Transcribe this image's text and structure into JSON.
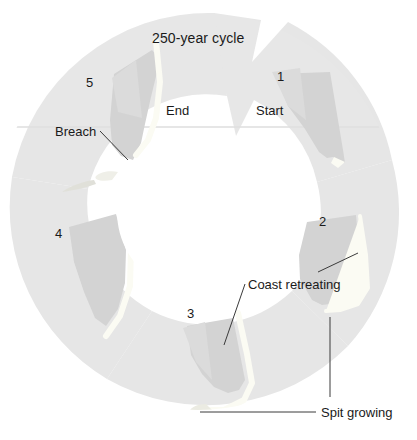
{
  "figure": {
    "title": "250-year cycle",
    "type": "cycle-diagram",
    "colors": {
      "background": "#ffffff",
      "ring": "#e6e6e6",
      "ring_shadow": "#dedede",
      "land_wedge": "#d2d2d2",
      "land_wedge_light": "#dcdcdc",
      "spit": "#fbfbf5",
      "leader_line": "#3a3a3a",
      "text": "#1a1a1a"
    }
  },
  "stages": [
    {
      "number": "1",
      "caption": "Start",
      "num_x": 277,
      "num_y": 69,
      "cap_x": 258,
      "cap_y": 103
    },
    {
      "number": "2",
      "caption": "",
      "num_x": 319,
      "num_y": 214,
      "cap_x": 0,
      "cap_y": 0
    },
    {
      "number": "3",
      "caption": "",
      "num_x": 187,
      "num_y": 306,
      "cap_x": 0,
      "cap_y": 0
    },
    {
      "number": "4",
      "caption": "",
      "num_x": 55,
      "num_y": 226,
      "cap_x": 0,
      "cap_y": 0
    },
    {
      "number": "5",
      "caption": "End",
      "num_x": 86,
      "num_y": 75,
      "cap_x": 167,
      "cap_y": 103
    }
  ],
  "annotations": [
    {
      "id": "breach",
      "label": "Breach",
      "x": 57,
      "y": 124
    },
    {
      "id": "coast-retreating",
      "label": "Coast retreating",
      "x": 248,
      "y": 277
    },
    {
      "id": "spit-growing",
      "label": "Spit growing",
      "x": 321,
      "y": 406
    }
  ]
}
